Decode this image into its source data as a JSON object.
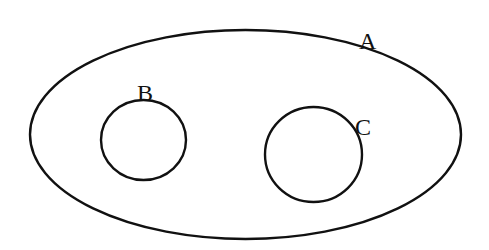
{
  "diagram": {
    "type": "venn-nested-sets",
    "stroke_color": "#111111",
    "background": "#ffffff",
    "sets": [
      {
        "id": "A",
        "label": "A",
        "shape": "ellipse",
        "cx": 245.5,
        "cy": 134.5,
        "rx": 215.5,
        "ry": 104.5,
        "label_x": 359,
        "label_y": 49
      },
      {
        "id": "B",
        "label": "B",
        "shape": "circle",
        "cx": 143.5,
        "cy": 140,
        "rx": 42.5,
        "ry": 40,
        "label_x": 137,
        "label_y": 101
      },
      {
        "id": "C",
        "label": "C",
        "shape": "circle",
        "cx": 313.5,
        "cy": 154.5,
        "rx": 48.5,
        "ry": 47.5,
        "label_x": 355,
        "label_y": 135
      }
    ],
    "relations": [
      "B ⊂ A",
      "C ⊂ A",
      "B ∩ C = ∅"
    ]
  }
}
